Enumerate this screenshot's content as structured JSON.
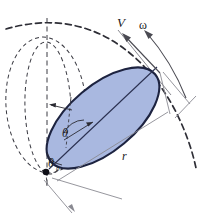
{
  "figure": {
    "name": "rolling-ellipse-kinematics-diagram",
    "background_color": "#ffffff",
    "width": 202,
    "height": 215,
    "colors": {
      "ellipse_fill": "#a9b8e0",
      "ellipse_stroke": "#1d2340",
      "dashed_stroke": "#3a3a42",
      "dimension_stroke": "#8a8a92",
      "arrow_stroke": "#4a4a52",
      "label_color": "#1a1a22",
      "vertex_dot": "#101018"
    },
    "labels": {
      "velocity": "V",
      "angular_velocity": "ω",
      "angle_theta": "θ",
      "angle_theta_zero": "θ",
      "angle_theta_zero_sub": "0",
      "radius": "r"
    }
  },
  "elements": {
    "ellipse_body": {
      "name": "tilted-ellipse-body",
      "center_x": 103,
      "center_y": 118,
      "semi_major": 68,
      "semi_minor": 33,
      "rotation_deg": -40
    },
    "trajectory_arc": {
      "name": "dashed-trajectory-arc",
      "description": "large dashed arc through apex"
    },
    "auxiliary_ellipses": {
      "name": "dashed-auxiliary-ellipses",
      "count": 2
    },
    "vertical_axis": {
      "name": "dashed-vertical-axis"
    },
    "contact_point": {
      "name": "contact-point-dot",
      "x": 46,
      "y": 172
    },
    "dimension_r": {
      "name": "radius-dimension-line"
    },
    "dimension_bottom": {
      "name": "bottom-dimension-line"
    },
    "dimension_right": {
      "name": "right-dimension-line"
    },
    "arrow_v": {
      "name": "velocity-arrow"
    },
    "arrow_omega": {
      "name": "angular-velocity-arrow"
    },
    "arc_theta": {
      "name": "theta-angle-arc"
    },
    "arc_theta_zero": {
      "name": "theta-zero-angle-arc"
    },
    "radius_pointer": {
      "name": "radius-pointer-arrow"
    },
    "major_axis_line": {
      "name": "ellipse-major-axis-line"
    }
  }
}
